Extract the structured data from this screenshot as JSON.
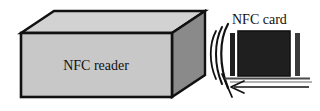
{
  "figure": {
    "background_color": "#ffffff",
    "width": 320,
    "height": 111
  },
  "reader": {
    "label": "NFC reader",
    "shape_name": "3d-box",
    "front_face_color": "#c8c8c8",
    "top_face_color": "#d2d2d2",
    "side_face_color": "#8a8a8a",
    "outline_color": "#111111",
    "geometry": {
      "front_top_left": [
        21,
        33
      ],
      "front_top_right": [
        172,
        33
      ],
      "front_bottom_right": [
        172,
        97
      ],
      "front_bottom_left": [
        21,
        97
      ],
      "back_top_left": [
        54,
        11
      ],
      "back_top_right": [
        205,
        11
      ],
      "back_bottom_right": [
        205,
        75
      ]
    }
  },
  "waves": {
    "icon_name": "nfc-wave-arcs",
    "count": 3,
    "stroke_color": "#111111",
    "description": "three concentric arcs radiating left from the card toward the reader"
  },
  "card": {
    "label": "NFC card",
    "body_color": "#1f1f1f",
    "border_color": "#111111",
    "left_bar_color": "#1f1f1f",
    "right_bar_color": "#3a3a3a",
    "geometry": {
      "body_x": 238,
      "body_y": 31,
      "body_width": 52,
      "body_height": 45,
      "left_bar_x": 230,
      "left_bar_y": 33,
      "left_bar_width": 5,
      "left_bar_height": 43,
      "right_bar_x": 295,
      "right_bar_y": 33,
      "right_bar_width": 5,
      "right_bar_height": 43
    }
  },
  "motion_arrow": {
    "icon_name": "arrow-left-icon",
    "direction": "left",
    "stroke_color": "#111111",
    "description": "horizontal arrow pointing left beneath the card indicating the card moving toward the reader",
    "from_x": 309,
    "to_x": 231,
    "y": 85
  },
  "baselines": {
    "upper_rule_color": "#4a4a4a",
    "lower_rule_color": "#9a9a9a",
    "description": "two horizontal rules under the card"
  }
}
